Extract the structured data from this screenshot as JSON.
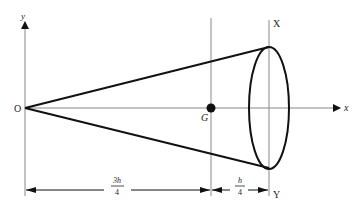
{
  "diagram": {
    "type": "cone-centroid",
    "labels": {
      "y_axis": "y",
      "x_axis": "x",
      "origin": "O",
      "centroid": "G",
      "top_point": "X",
      "bottom_point": "Y"
    },
    "dimensions": {
      "left": {
        "numerator": "3h",
        "denominator": "4"
      },
      "right": {
        "numerator": "h",
        "denominator": "4"
      }
    },
    "colors": {
      "axis": "#888888",
      "shape": "#111111",
      "text": "#222222"
    }
  }
}
